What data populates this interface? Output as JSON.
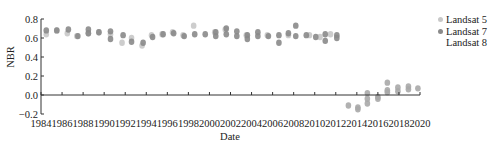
{
  "chart_data": {
    "type": "scatter",
    "title": "",
    "xlabel": "Date",
    "ylabel": "NBR",
    "xlim": [
      1984,
      2020
    ],
    "ylim": [
      -0.2,
      0.8
    ],
    "grid": false,
    "legend_position": "right",
    "x_ticks": [
      "1984",
      "1986",
      "1988",
      "1990",
      "1992",
      "1994",
      "1996",
      "1998",
      "2000",
      "2002",
      "2004",
      "2006",
      "2008",
      "2010",
      "2012",
      "2014",
      "2016",
      "2018",
      "2020"
    ],
    "y_ticks": [
      "-0.2",
      "0.0",
      "0.2",
      "0.4",
      "0.6",
      "0.8"
    ],
    "series": [
      {
        "name": "Landsat 5",
        "color": "#c8c8c8",
        "points": [
          [
            1984.5,
            0.64
          ],
          [
            1985.5,
            0.68
          ],
          [
            1986.5,
            0.65
          ],
          [
            1987.4,
            0.62
          ],
          [
            1988.5,
            0.65
          ],
          [
            1989.5,
            0.66
          ],
          [
            1990.6,
            0.64
          ],
          [
            1991.7,
            0.55
          ],
          [
            1992.6,
            0.6
          ],
          [
            1993.6,
            0.52
          ],
          [
            1994.5,
            0.63
          ],
          [
            1995.5,
            0.64
          ],
          [
            1996.5,
            0.66
          ],
          [
            1997.5,
            0.63
          ],
          [
            1998.5,
            0.73
          ],
          [
            2000.5,
            0.66
          ],
          [
            2001.5,
            0.69
          ],
          [
            2003.5,
            0.63
          ],
          [
            2005.5,
            0.63
          ],
          [
            2007.5,
            0.63
          ],
          [
            2009.5,
            0.63
          ],
          [
            2010.5,
            0.61
          ],
          [
            2011.5,
            0.64
          ]
        ]
      },
      {
        "name": "Landsat 7",
        "color": "#8a8a8a",
        "points": [
          [
            1984.5,
            0.68
          ],
          [
            1985.5,
            0.68
          ],
          [
            1986.6,
            0.69
          ],
          [
            1987.5,
            0.62
          ],
          [
            1988.5,
            0.69
          ],
          [
            1988.5,
            0.65
          ],
          [
            1989.5,
            0.66
          ],
          [
            1990.6,
            0.67
          ],
          [
            1990.6,
            0.59
          ],
          [
            1991.8,
            0.63
          ],
          [
            1992.6,
            0.56
          ],
          [
            1993.7,
            0.55
          ],
          [
            1994.6,
            0.61
          ],
          [
            1995.6,
            0.64
          ],
          [
            1996.6,
            0.65
          ],
          [
            1997.6,
            0.62
          ],
          [
            1998.6,
            0.64
          ],
          [
            1999.6,
            0.64
          ],
          [
            2000.6,
            0.66
          ],
          [
            2000.6,
            0.62
          ],
          [
            2001.6,
            0.7
          ],
          [
            2001.6,
            0.64
          ],
          [
            2002.6,
            0.67
          ],
          [
            2002.6,
            0.62
          ],
          [
            2003.6,
            0.63
          ],
          [
            2003.6,
            0.59
          ],
          [
            2004.6,
            0.66
          ],
          [
            2004.6,
            0.62
          ],
          [
            2005.6,
            0.62
          ],
          [
            2006.6,
            0.63
          ],
          [
            2006.6,
            0.55
          ],
          [
            2007.5,
            0.65
          ],
          [
            2008.2,
            0.73
          ],
          [
            2008.2,
            0.62
          ],
          [
            2009.2,
            0.63
          ],
          [
            2010.1,
            0.61
          ],
          [
            2011.0,
            0.64
          ],
          [
            2011.0,
            0.57
          ],
          [
            2012.1,
            0.63
          ],
          [
            2012.1,
            0.6
          ]
        ]
      },
      {
        "name": "Landsat 8",
        "color": "#aaaaaa",
        "points": [
          [
            2013.2,
            -0.11
          ],
          [
            2014.1,
            -0.15
          ],
          [
            2014.1,
            -0.13
          ],
          [
            2015.0,
            -0.09
          ],
          [
            2015.0,
            -0.04
          ],
          [
            2015.0,
            0.02
          ],
          [
            2016.0,
            -0.02
          ],
          [
            2016.0,
            -0.04
          ],
          [
            2016.9,
            0.13
          ],
          [
            2016.9,
            0.05
          ],
          [
            2016.9,
            0.03
          ],
          [
            2017.9,
            0.08
          ],
          [
            2017.9,
            0.04
          ],
          [
            2018.9,
            0.09
          ],
          [
            2018.9,
            0.06
          ],
          [
            2019.8,
            0.07
          ]
        ]
      }
    ]
  },
  "legend": {
    "items": [
      {
        "label": "Landsat 5",
        "color": "#c8c8c8"
      },
      {
        "label": "Landsat 7",
        "color": "#8a8a8a"
      },
      {
        "label": "Landsat 8",
        "color": "#ffffff"
      }
    ]
  },
  "axes": {
    "x_title": "Date",
    "y_title": "NBR"
  }
}
